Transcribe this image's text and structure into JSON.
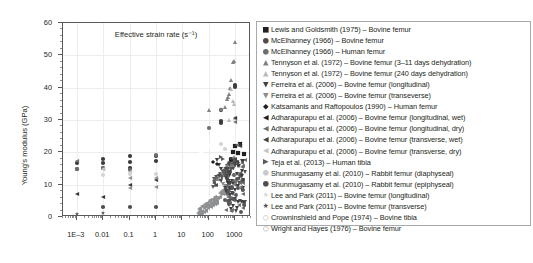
{
  "chart_data": {
    "type": "scatter",
    "title": "",
    "xlabel": "Effective strain rate (s⁻¹)",
    "ylabel": "Young's modulus (GPa)",
    "xscale": "log",
    "yscale": "linear",
    "xlim": [
      0.0003,
      4000
    ],
    "ylim": [
      0,
      60
    ],
    "xticks": [
      "1E–3",
      "0.01",
      "0.1",
      "1",
      "10",
      "100",
      "1000"
    ],
    "xtick_values": [
      0.001,
      0.01,
      0.1,
      1,
      10,
      100,
      1000
    ],
    "yticks": [
      "0",
      "10",
      "20",
      "30",
      "40",
      "50",
      "60"
    ],
    "ytick_values": [
      0,
      10,
      20,
      30,
      40,
      50,
      60
    ],
    "grid": true,
    "legend_position": "right",
    "series": [
      {
        "name": "Lewis and Goldsmith (1975) – Bovine femur",
        "marker": "square",
        "fill": "#231f20",
        "points": [
          [
            1000,
            22.0
          ],
          [
            1500,
            22.5
          ],
          [
            800,
            20.2
          ],
          [
            1300,
            19.8
          ],
          [
            2200,
            19.5
          ],
          [
            700,
            17.5
          ]
        ]
      },
      {
        "name": "McElhanney (1966) – Bovine femur",
        "marker": "circle",
        "fill": "#3c3a3b",
        "points": [
          [
            0.001,
            16.8
          ],
          [
            0.001,
            15.0
          ],
          [
            0.01,
            18.0
          ],
          [
            0.01,
            16.8
          ],
          [
            0.01,
            15.2
          ],
          [
            0.1,
            19.0
          ],
          [
            0.1,
            17.0
          ],
          [
            0.1,
            15.1
          ],
          [
            1,
            19.0
          ],
          [
            1,
            17.2
          ],
          [
            300,
            33.0
          ],
          [
            300,
            29.8
          ],
          [
            300,
            29.2
          ],
          [
            1000,
            40.8
          ],
          [
            1000,
            40.2
          ]
        ]
      },
      {
        "name": "McElhanney (1966) – Human femur",
        "marker": "circle",
        "fill": "#6d6e70",
        "points": [
          [
            0.001,
            14.9
          ],
          [
            0.01,
            15.1
          ],
          [
            0.1,
            14.6
          ],
          [
            1,
            19.2
          ],
          [
            100,
            27.5
          ],
          [
            300,
            13.0
          ],
          [
            1000,
            10.8
          ],
          [
            1000,
            5.2
          ],
          [
            700,
            6.0
          ]
        ]
      },
      {
        "name": "Tennyson et al. (1972) – Bovine femur (3–11 days dehydration)",
        "marker": "triangle-up",
        "fill": "#808284",
        "points": [
          [
            100,
            33.2
          ],
          [
            300,
            33.5
          ],
          [
            400,
            34.0
          ],
          [
            500,
            36.5
          ],
          [
            600,
            38.0
          ],
          [
            700,
            42.5
          ],
          [
            800,
            48.0
          ],
          [
            900,
            48.2
          ],
          [
            1000,
            54.0
          ],
          [
            550,
            37.2
          ],
          [
            650,
            39.8
          ]
        ]
      },
      {
        "name": "Tennyson et al. (1972) – Bovine femur (240 days dehydration)",
        "marker": "triangle-up",
        "fill": "#b9babc",
        "points": [
          [
            700,
            39.6
          ],
          [
            800,
            36.0
          ],
          [
            900,
            35.0
          ],
          [
            600,
            30.0
          ],
          [
            1000,
            30.5
          ]
        ]
      },
      {
        "name": "Ferreira et al. (2006) – Bovine femur (longitudinal)",
        "marker": "triangle-down",
        "fill": "#414042",
        "points": [
          [
            200,
            17.5
          ],
          [
            250,
            16.2
          ],
          [
            300,
            15.0
          ],
          [
            350,
            14.0
          ],
          [
            400,
            13.0
          ],
          [
            450,
            12.2
          ],
          [
            500,
            11.5
          ],
          [
            550,
            10.8
          ],
          [
            600,
            10.0
          ],
          [
            700,
            9.0
          ]
        ]
      },
      {
        "name": "Ferreira et al. (2006) – Bovine femur (transeverse)",
        "marker": "triangle-down",
        "fill": "#8a8c8e",
        "points": [
          [
            250,
            12.0
          ],
          [
            300,
            11.0
          ],
          [
            350,
            10.2
          ],
          [
            400,
            9.5
          ],
          [
            450,
            8.8
          ],
          [
            500,
            8.0
          ]
        ]
      },
      {
        "name": "Katsamanis and Raftopoulos (1990) – Human femur",
        "marker": "diamond",
        "fill": "#231f20",
        "points": [
          [
            150,
            17.0
          ],
          [
            200,
            16.5
          ]
        ]
      },
      {
        "name": "Adharapurapu et al. (2006) – Bovine femur (longitudinal, wet)",
        "marker": "triangle-left",
        "fill": "#3a3839",
        "points": [
          [
            0.001,
            7.0
          ],
          [
            0.01,
            6.2
          ],
          [
            0.1,
            10.0
          ],
          [
            1,
            11.5
          ],
          [
            1000,
            30.5
          ],
          [
            1200,
            17.0
          ],
          [
            1500,
            22.0
          ]
        ]
      },
      {
        "name": "Adharapurapu et al. (2006) – Bovine femur (longitudinal, dry)",
        "marker": "triangle-left",
        "fill": "#6f7072",
        "points": [
          [
            0.001,
            17.2
          ],
          [
            0.01,
            15.0
          ],
          [
            1000,
            29.5
          ],
          [
            1200,
            22.2
          ]
        ]
      },
      {
        "name": "Adharapurapu et al. (2006) – Bovine femur (transverse, wet)",
        "marker": "triangle-left",
        "fill": "#8c8e90",
        "points": [
          [
            0.1,
            9.0
          ],
          [
            1,
            9.3
          ],
          [
            0.1,
            12.0
          ],
          [
            1,
            12.1
          ]
        ]
      },
      {
        "name": "Adharapurapu et al. (2006) – Bovine femur (transverse, dry)",
        "marker": "triangle-left",
        "fill": "#c3c4c6",
        "points": [
          [
            0.01,
            15.0
          ],
          [
            0.1,
            13.8
          ]
        ]
      },
      {
        "name": "Teja et al. (2013) – Human tibia",
        "marker": "triangle-right",
        "fill": "#58595b",
        "points": [
          [
            300,
            18.5
          ],
          [
            350,
            18.0
          ]
        ]
      },
      {
        "name": "Shunmugasamy et al. (2010) – Rabbit femur (diaphyseal)",
        "marker": "circle",
        "fill": "#d3d4d6",
        "points": [
          [
            0.01,
            13.0
          ],
          [
            0.1,
            13.2
          ],
          [
            1,
            13.4
          ],
          [
            300,
            22.5
          ],
          [
            400,
            21.0
          ]
        ]
      },
      {
        "name": "Shunmugasamy et al. (2010) – Rabbit femur (epiphyseal)",
        "marker": "circle",
        "fill": "#4e4d4f",
        "points": [
          [
            0.01,
            3.0
          ],
          [
            0.1,
            3.2
          ],
          [
            1,
            3.1
          ]
        ]
      },
      {
        "name": "Lee and Park (2011) – Bovine femur (longitudinal)",
        "marker": "star",
        "fill": "#d8d9da",
        "points": [
          [
            0.001,
            0.8
          ],
          [
            0.01,
            1.2
          ]
        ]
      },
      {
        "name": "Lee and Park (2011) – Bovine femur (transverse)",
        "marker": "star",
        "fill": "#58595b",
        "points": [
          [
            0.001,
            0.9
          ],
          [
            0.01,
            1.3
          ]
        ]
      },
      {
        "name": "Crowninshield and Pope (1974) – Bovine tibia",
        "marker": "circle-open",
        "fill": "#ffffff",
        "points": [
          [
            100,
            22.0
          ],
          [
            200,
            24.5
          ],
          [
            50,
            20.0
          ]
        ]
      },
      {
        "name": "Wright and Hayes (1976) – Bovine femur",
        "marker": "circle-open",
        "fill": "#ffffff",
        "points": [
          [
            60,
            5.0
          ],
          [
            100,
            5.5
          ],
          [
            150,
            6.0
          ],
          [
            200,
            6.5
          ]
        ]
      }
    ],
    "dense_cluster_note": "Dense overlapping cluster of triangle-left and triangle-down markers between 50 and 2000 s⁻¹"
  },
  "legend": {
    "entries": [
      {
        "label": "Lewis and Goldsmith (1975) – Bovine femur",
        "marker": "square",
        "color": "#231f20"
      },
      {
        "label": "McElhanney (1966) – Bovine femur",
        "marker": "circle",
        "color": "#4d4b4c"
      },
      {
        "label": "McElhanney (1966) – Human femur",
        "marker": "circle",
        "color": "#6d6e70"
      },
      {
        "label": "Tennyson et al. (1972) – Bovine femur (3–11 days dehydration)",
        "marker": "triangle-up",
        "color": "#808284"
      },
      {
        "label": "Tennyson et al. (1972) – Bovine femur (240 days dehydration)",
        "marker": "triangle-up",
        "color": "#b9babc"
      },
      {
        "label": "Ferreira et al. (2006) – Bovine femur (longitudinal)",
        "marker": "triangle-down",
        "color": "#414042"
      },
      {
        "label": "Ferreira et al. (2006) – Bovine femur (transeverse)",
        "marker": "triangle-down",
        "color": "#8a8c8e"
      },
      {
        "label": "Katsamanis and Raftopoulos (1990) – Human femur",
        "marker": "diamond",
        "color": "#231f20"
      },
      {
        "label": "Adharapurapu et al. (2006) – Bovine femur (longitudinal, wet)",
        "marker": "triangle-left",
        "color": "#231f20"
      },
      {
        "label": "Adharapurapu et al. (2006) – Bovine femur (longitudinal, dry)",
        "marker": "triangle-left",
        "color": "#6f7072"
      },
      {
        "label": "Adharapurapu et al. (2006) – Bovine femur (transverse, wet)",
        "marker": "triangle-left",
        "color": "#414042"
      },
      {
        "label": "Adharapurapu et al. (2006) – Bovine femur (transverse, dry)",
        "marker": "triangle-left",
        "color": "#c3c4c6"
      },
      {
        "label": "Teja et al. (2013) – Human tibia",
        "marker": "triangle-right",
        "color": "#58595b"
      },
      {
        "label": "Shunmugasamy et al. (2010) – Rabbit femur (diaphyseal)",
        "marker": "circle",
        "color": "#c9cacc"
      },
      {
        "label": "Shunmugasamy et al. (2010) – Rabbit femur (epiphyseal)",
        "marker": "circle",
        "color": "#4e4d4f"
      },
      {
        "label": "Lee and Park (2011) – Bovine femur (longitudinal)",
        "marker": "star",
        "color": "#d8d9da"
      },
      {
        "label": "Lee and Park (2011) – Bovine femur (transverse)",
        "marker": "star",
        "color": "#58595b"
      },
      {
        "label": "Crowninshield and Pope (1974) – Bovine tibia",
        "marker": "circle-open",
        "color": "#d0d1d3"
      },
      {
        "label": "Wright and Hayes (1976) – Bovine femur",
        "marker": "circle-open",
        "color": "#c6c7c9"
      }
    ]
  },
  "colors": {
    "axis": "#58595b",
    "grid": "#ededee",
    "text": "#231f20",
    "legend_border": "#a7a9ac",
    "background": "#ffffff"
  }
}
